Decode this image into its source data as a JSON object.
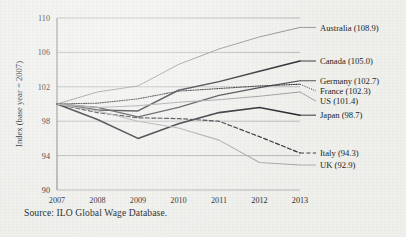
{
  "source_note": "Source: ILO Global Wage Database.",
  "chart_data": {
    "type": "line",
    "title": "",
    "subtitle": "",
    "xlabel": "",
    "ylabel": "Index (base year = 2007)",
    "x": [
      2007,
      2008,
      2009,
      2010,
      2011,
      2012,
      2013
    ],
    "categories": [
      "2007",
      "2008",
      "2009",
      "2010",
      "2011",
      "2012",
      "2013"
    ],
    "xlim": [
      2007,
      2013
    ],
    "ylim": [
      90,
      110
    ],
    "yticks": [
      90,
      94,
      98,
      102,
      106,
      110
    ],
    "ytick_labels": [
      "90",
      "94",
      "98",
      "102",
      "106",
      "110"
    ],
    "grid": true,
    "legend_position": "right-end-labels",
    "series": [
      {
        "name": "Australia",
        "end_label": "Australia (108.9)",
        "end_value": 108.9,
        "values": [
          100.0,
          101.4,
          102.1,
          104.6,
          106.4,
          107.8,
          108.9
        ],
        "color": "#8f8f92",
        "width": 1.0,
        "dash": "none"
      },
      {
        "name": "Canada",
        "end_label": "Canada (105.0)",
        "end_value": 105.0,
        "values": [
          100.0,
          99.3,
          99.2,
          101.6,
          102.6,
          103.8,
          105.0
        ],
        "color": "#24232a",
        "width": 1.5,
        "dash": "none"
      },
      {
        "name": "Germany",
        "end_label": "Germany (102.7)",
        "end_value": 102.7,
        "values": [
          100.0,
          99.6,
          98.5,
          99.6,
          101.0,
          101.9,
          102.7
        ],
        "color": "#3a3940",
        "width": 1.2,
        "dash": "none"
      },
      {
        "name": "France",
        "end_label": "France (102.3)",
        "end_value": 102.3,
        "values": [
          100.0,
          100.1,
          100.6,
          101.5,
          101.8,
          102.1,
          102.3
        ],
        "color": "#2b2a31",
        "width": 1.1,
        "dash": "dotted"
      },
      {
        "name": "US",
        "end_label": "US (101.4)",
        "end_value": 101.4,
        "values": [
          100.0,
          99.6,
          99.8,
          100.2,
          100.5,
          100.9,
          101.4
        ],
        "color": "#9a9a9d",
        "width": 1.0,
        "dash": "none"
      },
      {
        "name": "Japan",
        "end_label": "Japan (98.7)",
        "end_value": 98.7,
        "values": [
          100.0,
          98.2,
          96.0,
          97.7,
          99.0,
          99.6,
          98.7
        ],
        "color": "#201f26",
        "width": 1.6,
        "dash": "none"
      },
      {
        "name": "Italy",
        "end_label": "Italy (94.3)",
        "end_value": 94.3,
        "values": [
          100.0,
          99.0,
          98.4,
          98.3,
          98.0,
          96.2,
          94.3
        ],
        "color": "#2e2d34",
        "width": 1.2,
        "dash": "dashed"
      },
      {
        "name": "UK",
        "end_label": "UK (92.9)",
        "end_value": 92.9,
        "values": [
          100.0,
          99.2,
          98.0,
          97.2,
          95.8,
          93.2,
          92.9
        ],
        "color": "#a8a8ab",
        "width": 1.1,
        "dash": "none"
      }
    ]
  }
}
